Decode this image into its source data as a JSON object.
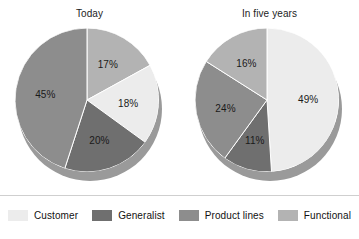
{
  "colors": {
    "customer": "#ececec",
    "generalist": "#6f6f6f",
    "product_lines": "#8d8d8d",
    "functional": "#b3b3b3",
    "depth": "#9a9a9a",
    "divider": "#cfcfcf",
    "label_text": "#1a1a1a",
    "background": "#ffffff"
  },
  "legend": {
    "items": [
      {
        "label": "Customer",
        "key": "customer",
        "color": "#ececec"
      },
      {
        "label": "Generalist",
        "key": "generalist",
        "color": "#6f6f6f"
      },
      {
        "label": "Product lines",
        "key": "product_lines",
        "color": "#8d8d8d"
      },
      {
        "label": "Functional",
        "key": "functional",
        "color": "#b3b3b3"
      }
    ]
  },
  "chart_data": [
    {
      "type": "pie",
      "title": "Today",
      "categories": [
        "Functional",
        "Customer",
        "Generalist",
        "Product lines"
      ],
      "values": [
        17,
        18,
        20,
        45
      ],
      "labels": [
        "17%",
        "18%",
        "20%",
        "45%"
      ],
      "colors": [
        "#b3b3b3",
        "#ececec",
        "#6f6f6f",
        "#8d8d8d"
      ],
      "start_angle_deg": 0,
      "direction": "clockwise",
      "units": "percent",
      "legend_position": "bottom",
      "grid": false
    },
    {
      "type": "pie",
      "title": "In five years",
      "categories": [
        "Customer",
        "Generalist",
        "Product lines",
        "Functional"
      ],
      "values": [
        49,
        11,
        24,
        16
      ],
      "labels": [
        "49%",
        "11%",
        "24%",
        "16%"
      ],
      "colors": [
        "#ececec",
        "#6f6f6f",
        "#8d8d8d",
        "#b3b3b3"
      ],
      "start_angle_deg": 0,
      "direction": "clockwise",
      "units": "percent",
      "legend_position": "bottom",
      "grid": false
    }
  ]
}
